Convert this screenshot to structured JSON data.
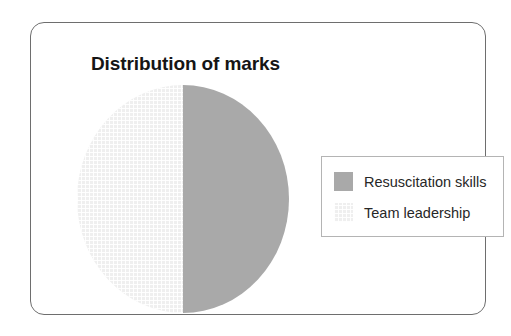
{
  "frame": {
    "border_color": "#6e6e6e",
    "background": "#ffffff"
  },
  "chart_data": {
    "type": "pie",
    "title": "Distribution of marks",
    "subtitle": "",
    "xlabel": "",
    "ylabel": "",
    "categories": [
      "Resuscitation skills",
      "Team leadership"
    ],
    "values": [
      50,
      50
    ],
    "value_unit": "%",
    "data_labels_shown": false,
    "grid": false,
    "legend_position": "right",
    "slices": [
      {
        "label": "Resuscitation skills",
        "value": 50,
        "color": "#a9a9a9",
        "fill": "solid",
        "position": "right half"
      },
      {
        "label": "Team leadership",
        "value": 50,
        "color": "#efefef",
        "fill": "grid-hatch",
        "position": "left half"
      }
    ],
    "legend": [
      {
        "label": "Resuscitation skills",
        "swatch": "solid"
      },
      {
        "label": "Team leadership",
        "swatch": "grid"
      }
    ]
  }
}
